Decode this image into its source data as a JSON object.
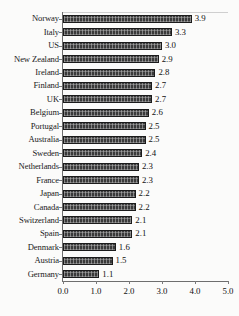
{
  "chart_data": {
    "type": "bar",
    "orientation": "horizontal",
    "title": "",
    "subtitle": "",
    "xlabel": "",
    "ylabel": "",
    "xlim": [
      0.0,
      5.0
    ],
    "xticks": [
      "0.0",
      "1.0",
      "2.0",
      "3.0",
      "4.0",
      "5.0"
    ],
    "xtick_values": [
      0.0,
      1.0,
      2.0,
      3.0,
      4.0,
      5.0
    ],
    "grid": false,
    "legend": null,
    "data_labels_shown": true,
    "bar_color": "#3a3a3a",
    "bar_edge_color": "#1b1b1b",
    "background_color": "#fbfbfa",
    "axis_color": "#6e6e6e",
    "categories": [
      "Norway",
      "Italy",
      "US",
      "New Zealand",
      "Ireland",
      "Finland",
      "UK",
      "Belgium",
      "Portugal",
      "Australia",
      "Sweden",
      "Netherlands",
      "France",
      "Japan",
      "Canada",
      "Switzerland",
      "Spain",
      "Denmark",
      "Austria",
      "Germany"
    ],
    "values": [
      3.9,
      3.3,
      3.0,
      2.9,
      2.8,
      2.7,
      2.7,
      2.6,
      2.5,
      2.5,
      2.4,
      2.3,
      2.3,
      2.2,
      2.2,
      2.1,
      2.1,
      1.6,
      1.5,
      1.1
    ],
    "value_labels": [
      "3.9",
      "3.3",
      "3.0",
      "2.9",
      "2.8",
      "2.7",
      "2.7",
      "2.6",
      "2.5",
      "2.5",
      "2.4",
      "2.3",
      "2.3",
      "2.2",
      "2.2",
      "2.1",
      "2.1",
      "1.6",
      "1.5",
      "1.1"
    ]
  }
}
